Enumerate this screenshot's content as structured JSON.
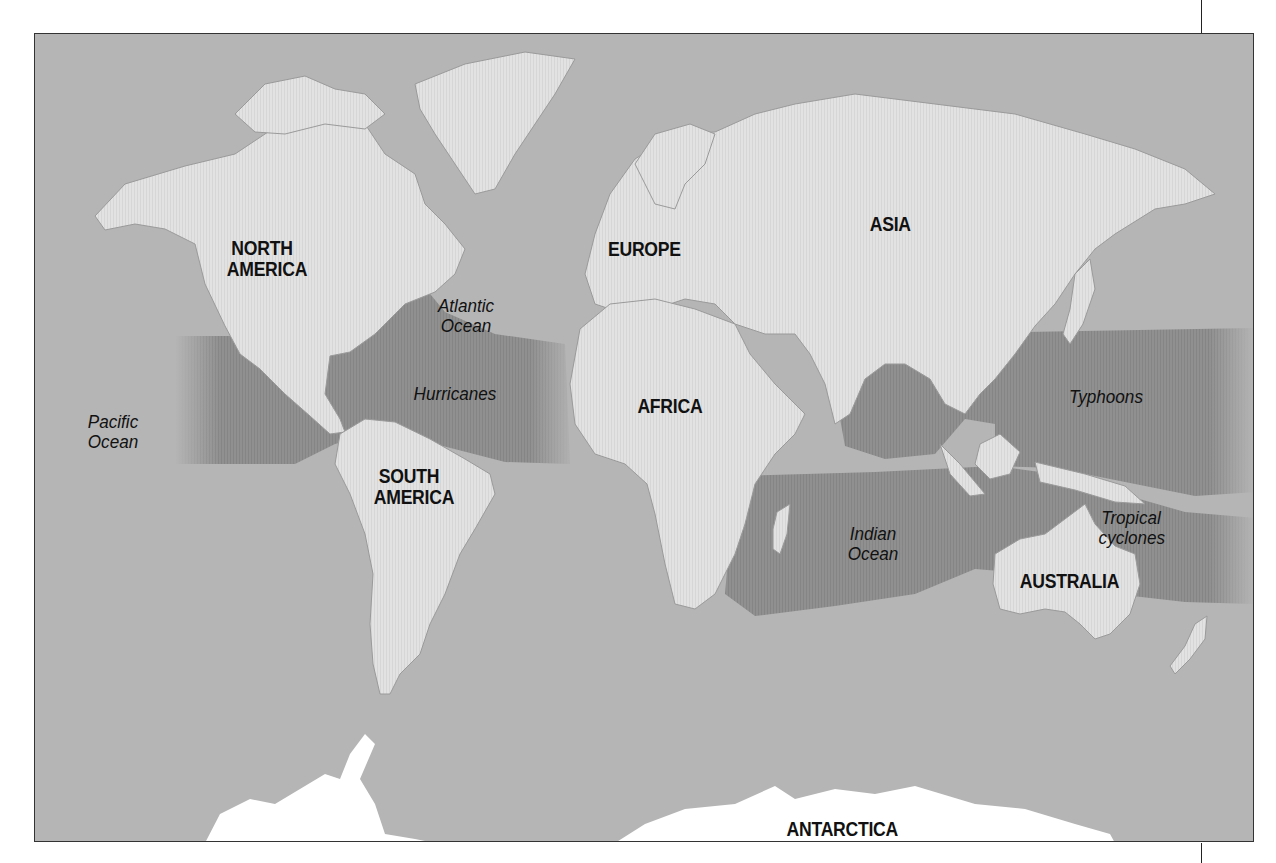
{
  "map": {
    "title": "",
    "colors": {
      "ocean": "#b5b5b5",
      "land": "#e1e1e1",
      "storm_zone": "#8e8e8e",
      "antarctica": "#ffffff",
      "frame": "#333333"
    },
    "continents": [
      {
        "id": "north-america",
        "label_line1": "NORTH",
        "label_line2": "AMERICA"
      },
      {
        "id": "south-america",
        "label_line1": "SOUTH",
        "label_line2": "AMERICA"
      },
      {
        "id": "europe",
        "label": "EUROPE"
      },
      {
        "id": "asia",
        "label": "ASIA"
      },
      {
        "id": "africa",
        "label": "AFRICA"
      },
      {
        "id": "australia",
        "label": "AUSTRALIA"
      },
      {
        "id": "antarctica",
        "label": "ANTARCTICA"
      }
    ],
    "oceans": [
      {
        "id": "pacific",
        "label_line1": "Pacific",
        "label_line2": "Ocean"
      },
      {
        "id": "atlantic",
        "label_line1": "Atlantic",
        "label_line2": "Ocean"
      },
      {
        "id": "indian",
        "label_line1": "Indian",
        "label_line2": "Ocean"
      }
    ],
    "storm_zones": [
      {
        "id": "hurricanes",
        "label": "Hurricanes"
      },
      {
        "id": "typhoons",
        "label": "Typhoons"
      },
      {
        "id": "tropical-cyclones",
        "label_line1": "Tropical",
        "label_line2": "cyclones"
      }
    ]
  }
}
